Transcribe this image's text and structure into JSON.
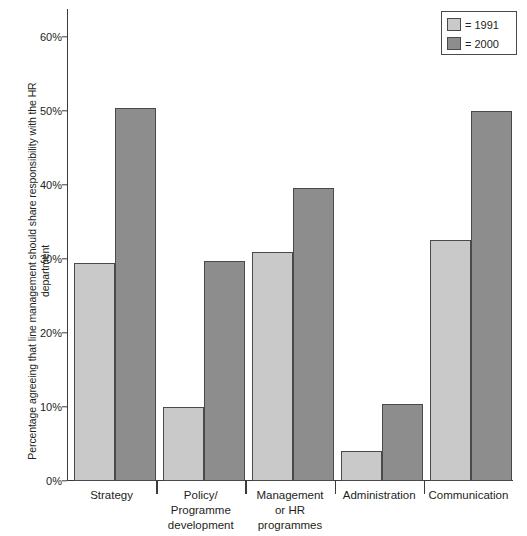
{
  "chart_data": {
    "type": "bar",
    "title": "",
    "xlabel": "",
    "ylabel": "Percentage agreeing that line management should share responsibility with the HR department",
    "ylim": [
      0,
      60
    ],
    "ytick_labels": [
      "0%",
      "10%",
      "20%",
      "30%",
      "40%",
      "50%",
      "60%"
    ],
    "ytick_values": [
      0,
      10,
      20,
      30,
      40,
      50,
      60
    ],
    "grid": false,
    "legend_position": "top-right",
    "categories": [
      "Strategy",
      "Policy/ Programme development",
      "Management or HR programmes",
      "Administration",
      "Communication"
    ],
    "category_lines": [
      [
        "Strategy"
      ],
      [
        "Policy/",
        "Programme",
        "development"
      ],
      [
        "Management",
        "or HR",
        "programmes"
      ],
      [
        "Administration"
      ],
      [
        "Communication"
      ]
    ],
    "series": [
      {
        "name": "1991",
        "legend_label": "= 1991",
        "color": "#c9c9c9",
        "values": [
          29.5,
          10.0,
          31.0,
          4.1,
          32.6
        ]
      },
      {
        "name": "2000",
        "legend_label": "= 2000",
        "color": "#8d8d8d",
        "values": [
          50.4,
          29.7,
          39.6,
          10.4,
          50.0
        ]
      }
    ]
  },
  "colors": {
    "series_1991": "#c9c9c9",
    "series_2000": "#8d8d8d",
    "axis": "#3b3b3b",
    "bar_outline": "#4a4a4a",
    "text": "#231f20",
    "background": "#ffffff"
  }
}
